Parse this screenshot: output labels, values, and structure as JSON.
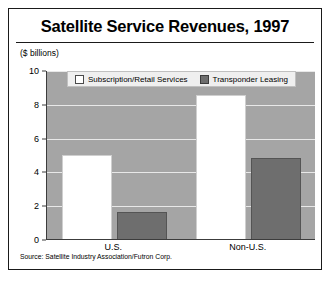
{
  "chart_data": {
    "type": "bar",
    "title": "Satellite Service Revenues, 1997",
    "subtitle": "($ billions)",
    "xlabel": "",
    "ylabel": "($ billions)",
    "categories": [
      "U.S.",
      "Non-U.S."
    ],
    "series": [
      {
        "name": "Subscription/Retail Services",
        "values": [
          5.0,
          8.5
        ],
        "color": "#ffffff"
      },
      {
        "name": "Transponder Leasing",
        "values": [
          1.6,
          4.8
        ],
        "color": "#6e6e6e"
      }
    ],
    "ylim": [
      0,
      10
    ],
    "yticks": [
      0,
      2,
      4,
      6,
      8,
      10
    ],
    "ytick_labels": [
      "0",
      "2",
      "4",
      "6",
      "8",
      "10"
    ],
    "grid": true,
    "legend_position": "top-center",
    "plot_background": "#a5a5a5",
    "source": "Source: Satellite Industry Association/Futron Corp."
  }
}
